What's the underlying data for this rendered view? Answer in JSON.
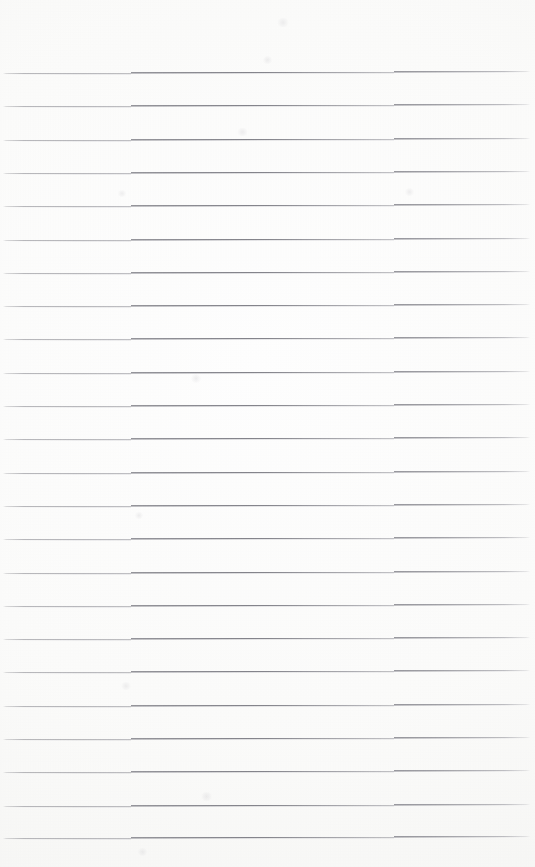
{
  "document": {
    "kind": "scanned-page",
    "subject": "blank ruled notebook page",
    "title": "",
    "body_text": "",
    "text_content_count": 0,
    "has_handwriting": false,
    "has_printed_text": false,
    "has_header": false,
    "has_footer": false,
    "has_page_number": false,
    "has_margin_rule": false,
    "has_holes": false
  },
  "page": {
    "width": 535,
    "height": 867,
    "background_color": "#fefefe",
    "paper_tone_color": "#f8f8f6",
    "orientation": "portrait"
  },
  "ruling": {
    "style": "horizontal-ruled",
    "line_color": "#a8a8ac",
    "line_core_color": "#84848b",
    "line_thickness_px": 1,
    "line_count": 24,
    "first_line_y": 73,
    "spacing_px": 33.3,
    "line_start_x": 3,
    "line_end_x": 530,
    "skew_rise_px": -2.0,
    "top_margin_px": 72,
    "bottom_margin_px": 29,
    "left_margin_px": 3,
    "right_margin_px": 5,
    "lines_y": [
      73.0,
      106.3,
      139.6,
      172.9,
      206.2,
      239.5,
      272.8,
      306.1,
      339.4,
      372.7,
      406.0,
      439.3,
      472.6,
      505.9,
      539.2,
      572.5,
      605.8,
      639.1,
      672.4,
      705.7,
      739.0,
      772.3,
      805.6,
      838.0
    ]
  },
  "artifacts": {
    "smudges": [
      {
        "x": 276,
        "y": 18,
        "w": 14,
        "h": 9
      },
      {
        "x": 262,
        "y": 56,
        "w": 11,
        "h": 8
      },
      {
        "x": 236,
        "y": 128,
        "w": 13,
        "h": 8
      },
      {
        "x": 190,
        "y": 374,
        "w": 12,
        "h": 9
      },
      {
        "x": 117,
        "y": 190,
        "w": 10,
        "h": 7
      },
      {
        "x": 404,
        "y": 188,
        "w": 11,
        "h": 8
      },
      {
        "x": 120,
        "y": 682,
        "w": 12,
        "h": 8
      },
      {
        "x": 200,
        "y": 792,
        "w": 13,
        "h": 9
      },
      {
        "x": 137,
        "y": 848,
        "w": 11,
        "h": 8
      },
      {
        "x": 134,
        "y": 512,
        "w": 10,
        "h": 7
      }
    ]
  }
}
